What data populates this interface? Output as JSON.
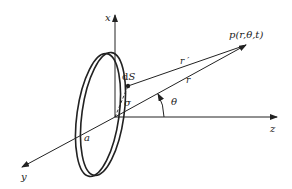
{
  "diagram": {
    "title": "",
    "axes": {
      "x_label": "x",
      "y_label": "y",
      "z_label": "z"
    },
    "labels": {
      "point": "p(r,θ,t)",
      "element": "dS",
      "r_prime": "r ′",
      "r": "r",
      "sigma": "σ",
      "theta": "θ",
      "radius": "a"
    },
    "colors": {
      "stroke": "#222222",
      "background": "#ffffff"
    }
  }
}
